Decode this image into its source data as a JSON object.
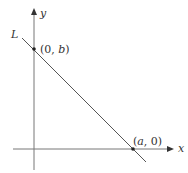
{
  "diagram": {
    "type": "coordinate-line",
    "axes": {
      "x_label": "x",
      "y_label": "y"
    },
    "line": {
      "label": "L",
      "color": "#555555"
    },
    "points": [
      {
        "label_open": "(0, ",
        "label_var": "b",
        "label_close": ")",
        "x": 34,
        "y": 49
      },
      {
        "label_open": "(",
        "label_var": "a",
        "label_close": ", 0)",
        "x": 133,
        "y": 149
      }
    ],
    "colors": {
      "axis": "#777777",
      "line": "#555555",
      "text": "#333333"
    }
  }
}
